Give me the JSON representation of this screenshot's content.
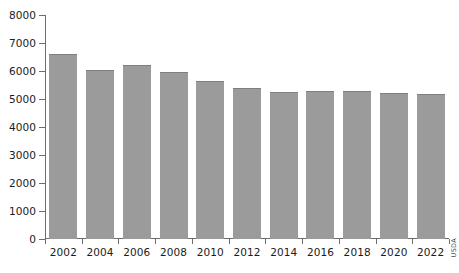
{
  "chart_data": {
    "type": "bar",
    "title": "",
    "subtitle": "",
    "xlabel": "",
    "ylabel": "",
    "categories": [
      "2002",
      "2004",
      "2006",
      "2008",
      "2010",
      "2012",
      "2014",
      "2016",
      "2018",
      "2020",
      "2022"
    ],
    "values": [
      6600,
      6050,
      6200,
      5950,
      5650,
      5400,
      5250,
      5300,
      5280,
      5200,
      5180
    ],
    "ylim": [
      0,
      8000
    ],
    "ytick_values": [
      0,
      1000,
      2000,
      3000,
      4000,
      5000,
      6000,
      7000,
      8000
    ],
    "ytick_labels": [
      "0",
      "1000",
      "2000",
      "3000",
      "4000",
      "5000",
      "6000",
      "7000",
      "8000"
    ],
    "grid": false,
    "legend": null,
    "legend_position": "none",
    "bar_color": "#9b9b9b",
    "bar_edge_color": "#7f7f7f",
    "axis_color": "#6d6d6d",
    "text_color": "#1b1b1b",
    "background_color": "#ffffff",
    "annotations": [
      {
        "name": "source-credit",
        "text": "USDA",
        "orientation": "vertical"
      }
    ]
  }
}
